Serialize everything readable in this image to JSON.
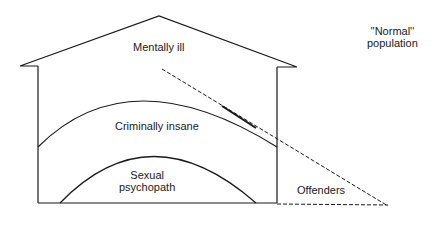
{
  "diagram": {
    "type": "nested-house-diagram",
    "regions": [
      {
        "id": "mentally-ill",
        "label": "Mentally ill"
      },
      {
        "id": "criminally-insane",
        "label": "Criminally insane"
      },
      {
        "id": "sexual-psychopath",
        "label_line1": "Sexual",
        "label_line2": "psychopath"
      },
      {
        "id": "offenders",
        "label": "Offenders"
      }
    ],
    "outside": {
      "label_line1": "''Normal''",
      "label_line2": "population"
    },
    "colors": {
      "line": "#1a1a1a",
      "background": "#ffffff"
    }
  }
}
